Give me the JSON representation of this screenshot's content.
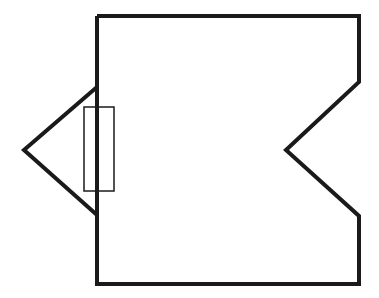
{
  "diagram": {
    "type": "line-drawing",
    "colors": {
      "background": "#ffffff",
      "stroke": "#1a1a1a"
    },
    "body_outline": {
      "points": "97,16 359,16 359,82 286,150 359,216 359,284 97,284 97,16",
      "stroke_width": 4
    },
    "left_triangle": {
      "points": "97,87 24,150 97,215",
      "stroke_width": 4
    },
    "rectangle": {
      "x": 84,
      "y": 107,
      "width": 30,
      "height": 84,
      "stroke_width": 1.5
    }
  }
}
